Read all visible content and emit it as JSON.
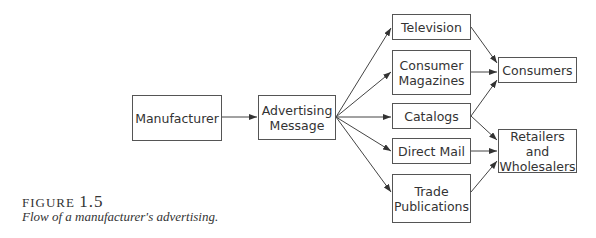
{
  "nodes": {
    "manufacturer": "Manufacturer",
    "advertising_message": "Advertising\nMessage",
    "television": "Television",
    "consumer_magazines": "Consumer\nMagazines",
    "catalogs": "Catalogs",
    "direct_mail": "Direct Mail",
    "trade_publications": "Trade\nPublications",
    "consumers": "Consumers",
    "retailers_wholesalers": "Retailers and\nWholesalers"
  },
  "edges": [
    [
      "Manufacturer",
      "Advertising Message"
    ],
    [
      "Advertising Message",
      "Television"
    ],
    [
      "Advertising Message",
      "Consumer Magazines"
    ],
    [
      "Advertising Message",
      "Catalogs"
    ],
    [
      "Advertising Message",
      "Direct Mail"
    ],
    [
      "Advertising Message",
      "Trade Publications"
    ],
    [
      "Television",
      "Consumers"
    ],
    [
      "Consumer Magazines",
      "Consumers"
    ],
    [
      "Catalogs",
      "Consumers"
    ],
    [
      "Catalogs",
      "Retailers and Wholesalers"
    ],
    [
      "Direct Mail",
      "Retailers and Wholesalers"
    ],
    [
      "Trade Publications",
      "Retailers and Wholesalers"
    ]
  ],
  "caption": {
    "label_prefix": "FIGURE ",
    "label_number": "1.5",
    "text": "Flow of a manufacturer's advertising."
  }
}
